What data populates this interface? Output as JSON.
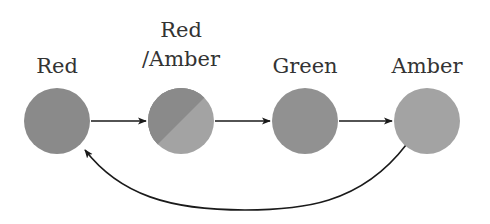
{
  "diagram": {
    "states": [
      {
        "id": "red",
        "label": "Red",
        "label_lines": [
          "Red"
        ],
        "fill": "#8a8a8a"
      },
      {
        "id": "red-amber",
        "label": "Red /Amber",
        "label_lines": [
          "Red",
          "/Amber"
        ],
        "fill": "#8a8a8a",
        "fill2": "#a3a3a3"
      },
      {
        "id": "green",
        "label": "Green",
        "label_lines": [
          "Green"
        ],
        "fill": "#919191"
      },
      {
        "id": "amber",
        "label": "Amber",
        "label_lines": [
          "Amber"
        ],
        "fill": "#a3a3a3"
      }
    ],
    "transitions": [
      {
        "from": "red",
        "to": "red-amber"
      },
      {
        "from": "red-amber",
        "to": "green"
      },
      {
        "from": "green",
        "to": "amber"
      },
      {
        "from": "amber",
        "to": "red",
        "curved": true
      }
    ],
    "colors": {
      "edge": "#1a1a1a",
      "text": "#333333"
    }
  }
}
